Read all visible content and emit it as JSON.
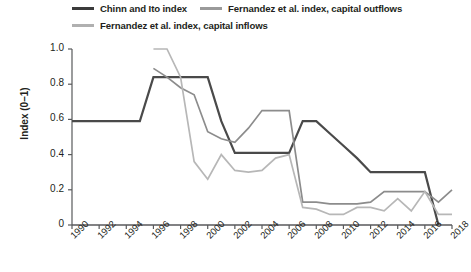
{
  "chart_data": {
    "type": "line",
    "title": "",
    "xlabel": "",
    "ylabel": "Index (0–1)",
    "xlim": [
      1990,
      2018
    ],
    "ylim": [
      0,
      1.0
    ],
    "grid": false,
    "legend_position": "top",
    "xticks": [
      "1990",
      "1992",
      "1994",
      "1996",
      "1998",
      "2000",
      "2002",
      "2004",
      "2006",
      "2008",
      "2010",
      "2012",
      "2014",
      "2016",
      "2018"
    ],
    "yticks": [
      "1.0",
      "0.8",
      "0.6",
      "0.4",
      "0.2",
      "0"
    ],
    "x": [
      1990,
      1991,
      1992,
      1993,
      1994,
      1995,
      1996,
      1997,
      1998,
      1999,
      2000,
      2001,
      2002,
      2003,
      2004,
      2005,
      2006,
      2007,
      2008,
      2009,
      2010,
      2011,
      2012,
      2013,
      2014,
      2015,
      2016,
      2017,
      2018
    ],
    "series": [
      {
        "name": "Chinn and Ito index",
        "color": "#4a4a4a",
        "x": [
          1990,
          1991,
          1992,
          1993,
          1994,
          1995,
          1996,
          1997,
          1998,
          1999,
          2000,
          2001,
          2002,
          2003,
          2004,
          2005,
          2006,
          2007,
          2008,
          2009,
          2010,
          2011,
          2012,
          2013,
          2014,
          2015,
          2016,
          2017
        ],
        "values": [
          0.59,
          0.59,
          0.59,
          0.59,
          0.59,
          0.59,
          0.84,
          0.84,
          0.84,
          0.84,
          0.84,
          0.59,
          0.41,
          0.41,
          0.41,
          0.41,
          0.41,
          0.59,
          0.59,
          0.52,
          0.45,
          0.38,
          0.3,
          0.3,
          0.3,
          0.3,
          0.3,
          0.0
        ]
      },
      {
        "name": "Fernandez et al. index, capital outflows",
        "color": "#8c8c8c",
        "x": [
          1996,
          1997,
          1998,
          1999,
          2000,
          2001,
          2002,
          2003,
          2004,
          2005,
          2006,
          2007,
          2008,
          2009,
          2010,
          2011,
          2012,
          2013,
          2014,
          2015,
          2016,
          2017,
          2018
        ],
        "values": [
          0.89,
          0.84,
          0.78,
          0.74,
          0.53,
          0.49,
          0.47,
          0.55,
          0.65,
          0.65,
          0.65,
          0.13,
          0.13,
          0.12,
          0.12,
          0.12,
          0.13,
          0.19,
          0.19,
          0.19,
          0.19,
          0.13,
          0.2
        ]
      },
      {
        "name": "Fernandez et al. index, capital inflows",
        "color": "#b7b7b7",
        "x": [
          1996,
          1997,
          1998,
          1999,
          2000,
          2001,
          2002,
          2003,
          2004,
          2005,
          2006,
          2007,
          2008,
          2009,
          2010,
          2011,
          2012,
          2013,
          2014,
          2015,
          2016,
          2017,
          2018
        ],
        "values": [
          1.0,
          1.0,
          0.84,
          0.36,
          0.26,
          0.4,
          0.31,
          0.3,
          0.31,
          0.38,
          0.4,
          0.1,
          0.09,
          0.06,
          0.06,
          0.1,
          0.1,
          0.08,
          0.15,
          0.08,
          0.19,
          0.06,
          0.06
        ]
      }
    ]
  },
  "legend": {
    "items": [
      {
        "label": "Chinn and Ito index",
        "color": "#4a4a4a"
      },
      {
        "label": "Fernandez et al. index, capital outflows",
        "color": "#8c8c8c"
      },
      {
        "label": "Fernandez et al. index, capital inflows",
        "color": "#b7b7b7"
      }
    ]
  },
  "axes": {
    "y_title": "Index (0–1)"
  }
}
